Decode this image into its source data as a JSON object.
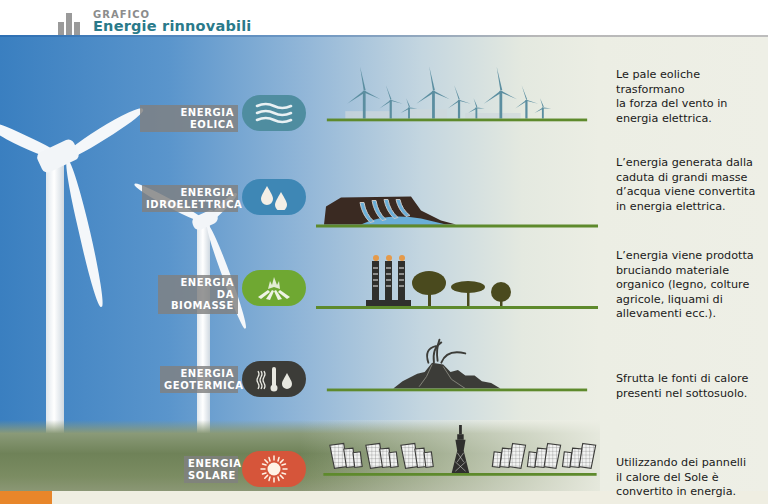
{
  "header": {
    "kicker": "GRAFICO",
    "title": "Energie rinnovabili"
  },
  "colors": {
    "title": "#2a7a8a",
    "eolica": "#4f8da0",
    "idroelettrica": "#3e87b5",
    "biomasse": "#6fa832",
    "geotermica": "#3c3c38",
    "solare": "#d6553a",
    "ground": "#5e8a2c",
    "accent_tab": "#e8862a"
  },
  "rows": [
    {
      "id": "eolica",
      "label_lines": [
        "ENERGIA EOLICA"
      ],
      "icon": "wind-waves-icon",
      "scene": "wind-farm",
      "description_lines": [
        "Le pale eoliche",
        "trasformano",
        "la forza del vento in",
        "energia elettrica."
      ]
    },
    {
      "id": "idroelettrica",
      "label_lines": [
        "ENERGIA",
        "IDROELETTRICA"
      ],
      "icon": "water-drops-icon",
      "scene": "dam",
      "description_lines": [
        "L’energia generata dalla",
        "caduta di grandi masse",
        "d’acqua viene convertita",
        "in energia elettrica."
      ]
    },
    {
      "id": "biomasse",
      "label_lines": [
        "ENERGIA",
        "DA BIOMASSE"
      ],
      "icon": "campfire-icon",
      "scene": "smokestacks-and-trees",
      "description_lines": [
        "L’energia viene prodotta",
        "bruciando materiale",
        "organico (legno, colture",
        "agricole, liquami di",
        "allevamenti ecc.)."
      ]
    },
    {
      "id": "geotermica",
      "label_lines": [
        "ENERGIA",
        "GEOTERMICA"
      ],
      "icon": "heat-thermometer-drop-icon",
      "scene": "volcano",
      "description_lines": [
        "Sfrutta le fonti di calore",
        "presenti nel sottosuolo."
      ]
    },
    {
      "id": "solare",
      "label_lines": [
        "ENERGIA",
        "SOLARE"
      ],
      "icon": "sun-icon",
      "scene": "solar-panels-and-tower",
      "description_lines": [
        "Utilizzando dei pannelli",
        "il calore del Sole è",
        "convertito in energia."
      ]
    }
  ]
}
